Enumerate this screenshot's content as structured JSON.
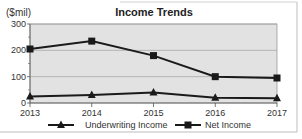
{
  "chart_data": {
    "type": "line",
    "title": "Income Trends",
    "ylabel": "($mil)",
    "xlabel": "",
    "x": [
      "2013",
      "2014",
      "2015",
      "2016",
      "2017"
    ],
    "ylim": [
      0,
      300
    ],
    "yticks": [
      "0",
      "100",
      "200",
      "300"
    ],
    "grid": true,
    "legend_position": "bottom",
    "series": [
      {
        "name": "Underwriting Income",
        "marker": "triangle",
        "values": [
          25,
          30,
          40,
          20,
          18
        ]
      },
      {
        "name": "Net Income",
        "marker": "square",
        "values": [
          205,
          235,
          180,
          100,
          95
        ]
      }
    ]
  },
  "colors": {
    "plot_background": "#e2e2e2",
    "line": "#1a1a1a",
    "grid": "#a8a8a8",
    "frame": "#bdbdbd"
  }
}
